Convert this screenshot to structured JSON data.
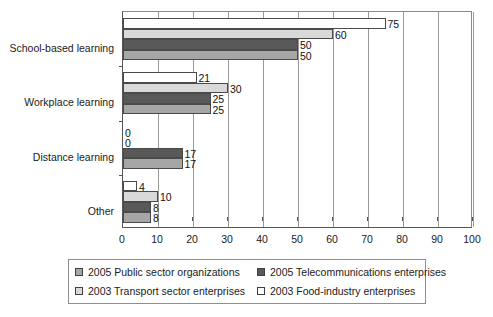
{
  "chart_data": {
    "type": "bar",
    "orientation": "horizontal",
    "title": "",
    "xlabel": "",
    "ylabel": "",
    "xlim": [
      0,
      100
    ],
    "xticks": [
      0,
      10,
      20,
      30,
      40,
      50,
      60,
      70,
      80,
      90,
      100
    ],
    "grid": true,
    "legend_position": "bottom",
    "categories": [
      "School-based learning",
      "Workplace learning",
      "Distance learning",
      "Other"
    ],
    "series": [
      {
        "name": "2003 Food-industry enterprises",
        "color": "#ffffff",
        "values": [
          75,
          21,
          0,
          4
        ]
      },
      {
        "name": "2003 Transport sector enterprises",
        "color": "#d9d9d9",
        "values": [
          60,
          30,
          0,
          10
        ]
      },
      {
        "name": "2005 Telecommunications enterprises",
        "color": "#595959",
        "values": [
          50,
          25,
          17,
          8
        ]
      },
      {
        "name": "2005 Public sector organizations",
        "color": "#a6a6a6",
        "values": [
          50,
          25,
          17,
          8
        ]
      }
    ]
  },
  "legend": {
    "entries": [
      {
        "label": "2005 Public sector organizations",
        "color": "#a6a6a6"
      },
      {
        "label": "2005 Telecommunications enterprises",
        "color": "#595959"
      },
      {
        "label": "2003 Transport sector enterprises",
        "color": "#d9d9d9"
      },
      {
        "label": "2003 Food-industry enterprises",
        "color": "#ffffff"
      }
    ]
  },
  "colors": {
    "public_sector": "#a6a6a6",
    "telecom": "#595959",
    "transport": "#d9d9d9",
    "food_industry": "#ffffff",
    "axis": "#555555",
    "gridline": "#9a9a9a",
    "bar_outline": "#4a4a4a",
    "text": "#1a1a1a"
  }
}
